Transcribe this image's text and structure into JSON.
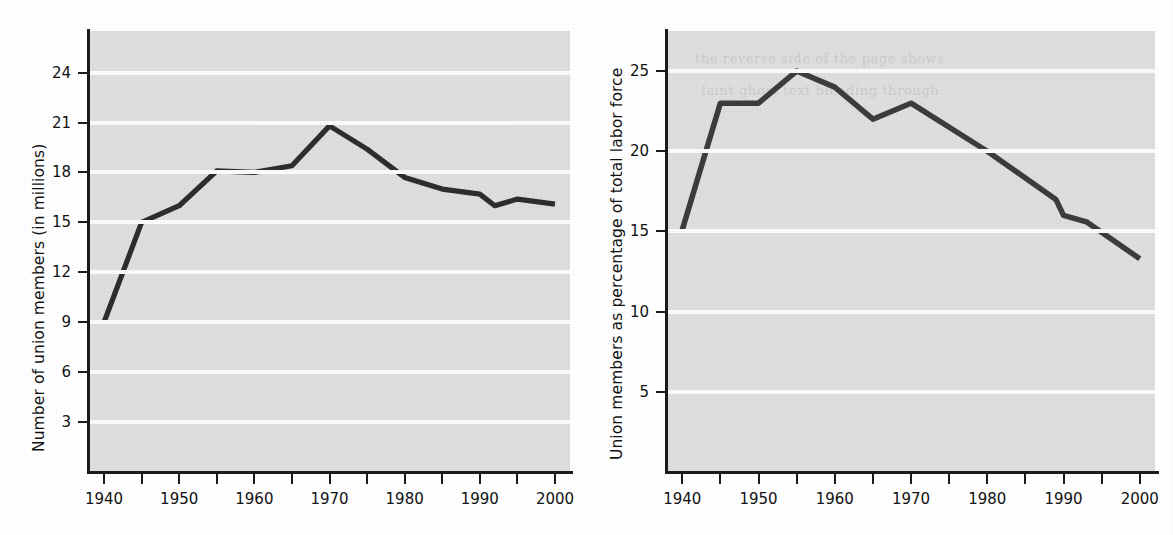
{
  "figure": {
    "charts": [
      {
        "id": "union-members-count",
        "ylabel": "Number of union members (in millions)",
        "xlabel": "",
        "yticks": [
          "3",
          "6",
          "9",
          "12",
          "15",
          "18",
          "21",
          "24"
        ],
        "xticks": [
          "1940",
          "1950",
          "1960",
          "1970",
          "1980",
          "1990",
          "2000"
        ],
        "line_color": "#2d2d2d",
        "plot_bg": "#dedede",
        "gridline_color": "#fbfbfb"
      },
      {
        "id": "union-members-percent",
        "ylabel": "Union members as percentage of total labor force",
        "xlabel": "",
        "yticks": [
          "5",
          "10",
          "15",
          "20",
          "25"
        ],
        "xticks": [
          "1940",
          "1950",
          "1960",
          "1970",
          "1980",
          "1990",
          "2000"
        ],
        "line_color": "#3c3c3c",
        "plot_bg": "#dedede",
        "gridline_color": "#fbfbfb"
      }
    ],
    "showthrough_lines": [
      "the reverse side of the page shows",
      "faint ghost text bleeding through"
    ]
  },
  "chart_data": [
    {
      "type": "line",
      "title": "",
      "xlabel": "",
      "ylabel": "Number of union members (in millions)",
      "x": [
        1940,
        1945,
        1950,
        1955,
        1960,
        1965,
        1970,
        1975,
        1980,
        1985,
        1990,
        1992,
        1995,
        2000
      ],
      "values": [
        9.0,
        15.0,
        16.0,
        18.1,
        18.0,
        18.4,
        20.8,
        19.4,
        17.7,
        17.0,
        16.7,
        16.0,
        16.4,
        16.1
      ],
      "xlim": [
        1938,
        2002
      ],
      "ylim": [
        0,
        26.5
      ],
      "xticks": [
        1940,
        1945,
        1950,
        1955,
        1960,
        1965,
        1970,
        1975,
        1980,
        1985,
        1990,
        1995,
        2000
      ],
      "xticklabels": [
        "1940",
        "",
        "1950",
        "",
        "1960",
        "",
        "1970",
        "",
        "1980",
        "",
        "1990",
        "",
        "2000"
      ],
      "yticks": [
        3,
        6,
        9,
        12,
        15,
        18,
        21,
        24
      ],
      "grid": "horizontal",
      "legend": "none",
      "series_name": "Union members (millions)"
    },
    {
      "type": "line",
      "title": "",
      "xlabel": "",
      "ylabel": "Union members as percentage of total labor force",
      "x": [
        1940,
        1945,
        1950,
        1955,
        1960,
        1965,
        1970,
        1980,
        1989,
        1990,
        1993,
        2000
      ],
      "values": [
        15.1,
        23.0,
        23.0,
        25.0,
        24.0,
        22.0,
        23.0,
        20.0,
        17.0,
        16.0,
        15.6,
        13.3
      ],
      "xlim": [
        1938,
        2002
      ],
      "ylim": [
        0,
        27.5
      ],
      "xticks": [
        1940,
        1945,
        1950,
        1955,
        1960,
        1965,
        1970,
        1975,
        1980,
        1985,
        1990,
        1995,
        2000
      ],
      "xticklabels": [
        "1940",
        "",
        "1950",
        "",
        "1960",
        "",
        "1970",
        "",
        "1980",
        "",
        "1990",
        "",
        "2000"
      ],
      "yticks": [
        5,
        10,
        15,
        20,
        25
      ],
      "grid": "horizontal",
      "legend": "none",
      "series_name": "Union members as % of labor force"
    }
  ]
}
